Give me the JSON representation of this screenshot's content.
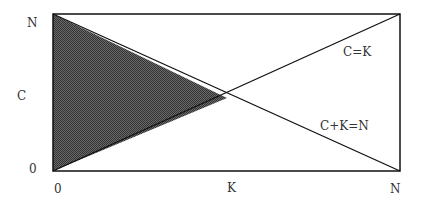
{
  "diagram": {
    "y_axis": {
      "label": "C",
      "top_tick": "N",
      "bottom_tick": "0"
    },
    "x_axis": {
      "left_tick": "0",
      "middle_tick": "K",
      "right_tick": "N"
    },
    "lines": [
      {
        "label": "C=K"
      },
      {
        "label": "C+K=N"
      }
    ],
    "shaded_region_color": "#555555",
    "line_color": "#111111"
  }
}
